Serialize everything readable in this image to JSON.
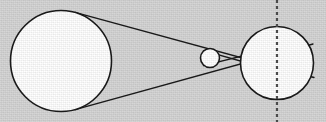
{
  "figure": {
    "type": "geometric-diagram",
    "canvas": {
      "width": 326,
      "height": 122
    },
    "colors": {
      "background": "#d6d6d6",
      "body_fill": "#ffffff",
      "outline": "#1a1a1a",
      "ray_line": "#1a1a1a",
      "axis_dashed": "#4d4d4d"
    },
    "bodies": [
      {
        "name": "large-left-circle",
        "role": "light-source",
        "cx": 61,
        "cy": 61,
        "r": 50.5,
        "fill": "#ffffff",
        "stroke": "#1a1a1a",
        "stroke_width": 1.6
      },
      {
        "name": "small-middle-circle",
        "role": "occulting-body",
        "cx": 210,
        "cy": 58,
        "r": 9.5,
        "fill": "#ffffff",
        "stroke": "#1a1a1a",
        "stroke_width": 1.6
      },
      {
        "name": "large-right-circle",
        "role": "shadowed-body",
        "cx": 277,
        "cy": 63,
        "r": 36.5,
        "fill": "#ffffff",
        "stroke": "#1a1a1a",
        "stroke_width": 1.6
      }
    ],
    "rays": [
      {
        "name": "upper-outer-tangent-ray",
        "x1": 75,
        "y1": 12.4,
        "x2": 314,
        "y2": 77.5,
        "stroke": "#1a1a1a",
        "stroke_width": 1.3
      },
      {
        "name": "lower-outer-tangent-ray",
        "x1": 75,
        "y1": 109.6,
        "x2": 313,
        "y2": 44.0,
        "stroke": "#1a1a1a",
        "stroke_width": 1.3
      },
      {
        "name": "upper-inner-chord-ray",
        "x1": 203.5,
        "y1": 50.6,
        "x2": 260,
        "y2": 66.5,
        "stroke": "#1a1a1a",
        "stroke_width": 1.3
      },
      {
        "name": "lower-inner-chord-ray",
        "x1": 203.5,
        "y1": 65.6,
        "x2": 262,
        "y2": 51.0,
        "stroke": "#1a1a1a",
        "stroke_width": 1.3
      }
    ],
    "crossing_points": [
      {
        "name": "primary-ray-crossing",
        "x": 185,
        "y": 61
      },
      {
        "name": "secondary-ray-crossing",
        "x": 231,
        "y": 58.5
      }
    ],
    "axis": {
      "name": "vertical-dashed-axis",
      "x": 277,
      "y1": 0,
      "y2": 122,
      "stroke": "#4d4d4d",
      "stroke_width": 2.2,
      "dash_pattern": "3 3"
    }
  }
}
